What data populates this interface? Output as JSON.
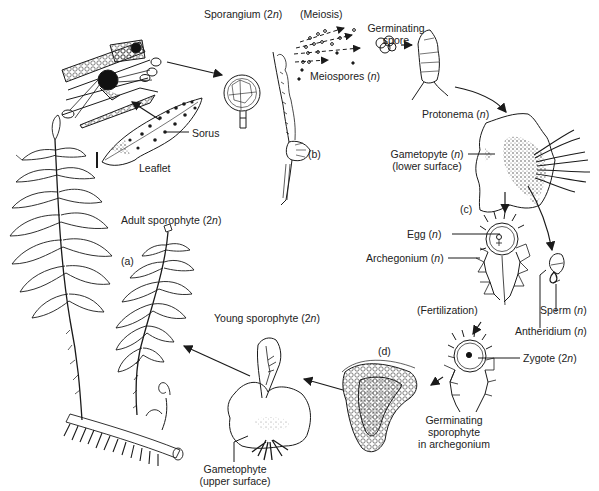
{
  "diagram": {
    "type": "life-cycle",
    "stages": [
      {
        "id": "a",
        "marker": "(a)",
        "label": "Adult sporophyte (2n)"
      },
      {
        "id": "b",
        "marker": "(b)",
        "label": "Sporangium (2n)"
      },
      {
        "id": "c",
        "marker": "(c)",
        "label": "Gametopyte (n) (lower surface)"
      },
      {
        "id": "d",
        "marker": "(d)",
        "label": "Germinating sporophyte in archegonium"
      }
    ]
  },
  "labels": {
    "sporangium": {
      "text": "Sporangium (2",
      "n": "n",
      "close": ")"
    },
    "meiosis": "(Meiosis)",
    "germinating_spore_1": "Germinating",
    "germinating_spore_2": "spore",
    "meiospores": {
      "text": "Meiospores (",
      "n": "n",
      "close": ")"
    },
    "sorus": "Sorus",
    "leaflet": "Leaflet",
    "protonema": {
      "text": "Protonema (",
      "n": "n",
      "close": ")"
    },
    "gametopyte_lower_1": {
      "text": "Gametopyte (",
      "n": "n",
      "close": ")"
    },
    "gametopyte_lower_2": "(lower surface)",
    "marker_b": "(b)",
    "marker_c": "(c)",
    "adult_sporophyte": {
      "text": "Adult sporophyte (2",
      "n": "n",
      "close": ")"
    },
    "marker_a": "(a)",
    "egg": {
      "text": "Egg (",
      "n": "n",
      "close": ")"
    },
    "archegonium": {
      "text": "Archegonium (",
      "n": "n",
      "close": ")"
    },
    "sperm": {
      "text": "Sperm (",
      "n": "n",
      "close": ")"
    },
    "antheridium": {
      "text": "Antheridium (",
      "n": "n",
      "close": ")"
    },
    "fertilization": "(Fertilization)",
    "young_sporophyte": {
      "text": "Young sporophyte (2",
      "n": "n",
      "close": ")"
    },
    "marker_d": "(d)",
    "zygote": {
      "text": "Zygote (2",
      "n": "n",
      "close": ")"
    },
    "germinating_sporophyte_1": "Germinating",
    "germinating_sporophyte_2": "sporophyte",
    "germinating_sporophyte_3": "in archegonium",
    "gametophyte_upper_1": "Gametophyte",
    "gametophyte_upper_2": "(upper surface)"
  },
  "colors": {
    "ink": "#1a1a1a",
    "background": "#ffffff"
  }
}
